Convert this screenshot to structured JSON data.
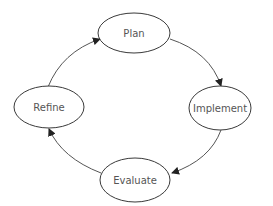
{
  "diagram": {
    "type": "cycle",
    "nodes": [
      {
        "id": "plan",
        "label": "Plan",
        "cx": 134,
        "cy": 33,
        "rx": 36,
        "ry": 20
      },
      {
        "id": "implement",
        "label": "Implement",
        "cx": 220,
        "cy": 108,
        "rx": 31,
        "ry": 22
      },
      {
        "id": "evaluate",
        "label": "Evaluate",
        "cx": 135,
        "cy": 180,
        "rx": 35,
        "ry": 22
      },
      {
        "id": "refine",
        "label": "Refine",
        "cx": 49,
        "cy": 107,
        "rx": 35,
        "ry": 21
      }
    ],
    "edges": [
      {
        "from": "plan",
        "to": "implement"
      },
      {
        "from": "implement",
        "to": "evaluate"
      },
      {
        "from": "evaluate",
        "to": "refine"
      },
      {
        "from": "refine",
        "to": "plan"
      }
    ],
    "colors": {
      "stroke": "#3a3a3a",
      "text": "#555555",
      "background": "#ffffff"
    }
  }
}
